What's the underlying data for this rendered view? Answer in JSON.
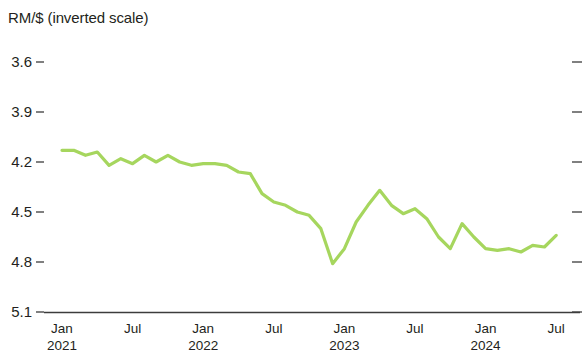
{
  "chart_data": {
    "type": "line",
    "title": "RM/$ (inverted scale)",
    "xlabel": "",
    "ylabel": "RM/$ (inverted scale)",
    "inverted_y": true,
    "grid": false,
    "legend": "none",
    "line_color": "#a6d65e",
    "ylim": [
      3.6,
      5.1
    ],
    "yticks": [
      3.6,
      3.9,
      4.2,
      4.5,
      4.8,
      5.1
    ],
    "ytick_labels": [
      "3.6",
      "3.9",
      "4.2",
      "4.5",
      "4.8",
      "5.1"
    ],
    "xticks": [
      {
        "month": "Jan",
        "year": "2021"
      },
      {
        "month": "Jul",
        "year": ""
      },
      {
        "month": "Jan",
        "year": "2022"
      },
      {
        "month": "Jul",
        "year": ""
      },
      {
        "month": "Jan",
        "year": "2023"
      },
      {
        "month": "Jul",
        "year": ""
      },
      {
        "month": "Jan",
        "year": "2024"
      },
      {
        "month": "Jul",
        "year": ""
      }
    ],
    "x_labels": [
      "Jan 2021",
      "Feb 2021",
      "Mar 2021",
      "Apr 2021",
      "May 2021",
      "Jun 2021",
      "Jul 2021",
      "Aug 2021",
      "Sep 2021",
      "Oct 2021",
      "Nov 2021",
      "Dec 2021",
      "Jan 2022",
      "Feb 2022",
      "Mar 2022",
      "Apr 2022",
      "May 2022",
      "Jun 2022",
      "Jul 2022",
      "Aug 2022",
      "Sep 2022",
      "Oct 2022",
      "Nov 2022",
      "Dec 2022",
      "Jan 2023",
      "Feb 2023",
      "Mar 2023",
      "Apr 2023",
      "May 2023",
      "Jun 2023",
      "Jul 2023",
      "Aug 2023",
      "Sep 2023",
      "Oct 2023",
      "Nov 2023",
      "Dec 2023",
      "Jan 2024",
      "Feb 2024",
      "Mar 2024",
      "Apr 2024",
      "May 2024",
      "Jun 2024",
      "Jul 2024"
    ],
    "values": [
      4.13,
      4.13,
      4.16,
      4.14,
      4.22,
      4.18,
      4.21,
      4.16,
      4.2,
      4.16,
      4.2,
      4.22,
      4.21,
      4.21,
      4.22,
      4.26,
      4.27,
      4.39,
      4.44,
      4.46,
      4.5,
      4.52,
      4.6,
      4.81,
      4.72,
      4.56,
      4.46,
      4.37,
      4.46,
      4.51,
      4.48,
      4.54,
      4.65,
      4.72,
      4.57,
      4.65,
      4.72,
      4.73,
      4.72,
      4.74,
      4.7,
      4.71,
      4.64
    ],
    "series": [
      {
        "name": "RM/$",
        "color": "#a6d65e",
        "values": [
          4.13,
          4.13,
          4.16,
          4.14,
          4.22,
          4.18,
          4.21,
          4.16,
          4.2,
          4.16,
          4.2,
          4.22,
          4.21,
          4.21,
          4.22,
          4.26,
          4.27,
          4.39,
          4.44,
          4.46,
          4.5,
          4.52,
          4.6,
          4.81,
          4.72,
          4.56,
          4.46,
          4.37,
          4.46,
          4.51,
          4.48,
          4.54,
          4.65,
          4.72,
          4.57,
          4.65,
          4.72,
          4.73,
          4.72,
          4.74,
          4.7,
          4.71,
          4.64
        ]
      }
    ]
  },
  "axis": {
    "baseline_value": "5.1"
  }
}
